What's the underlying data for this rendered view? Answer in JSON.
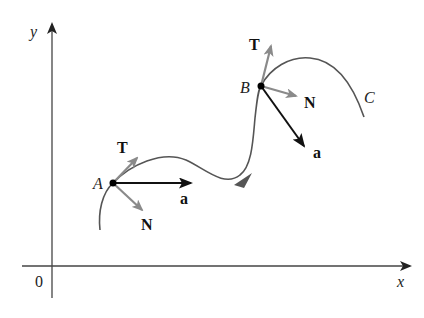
{
  "diagram": {
    "axes": {
      "x_label": "x",
      "y_label": "y",
      "origin_label": "0"
    },
    "curve": {
      "label": "C",
      "has_direction_arrow": true
    },
    "points": [
      {
        "label": "A",
        "vectors": {
          "tangent": "T",
          "normal": "N",
          "acceleration": "a"
        }
      },
      {
        "label": "B",
        "vectors": {
          "tangent": "T",
          "normal": "N",
          "acceleration": "a"
        }
      }
    ],
    "colors": {
      "axis": "#333333",
      "curve": "#555555",
      "unit_vectors": "#888888",
      "acceleration": "#111111",
      "point": "#000000"
    }
  }
}
